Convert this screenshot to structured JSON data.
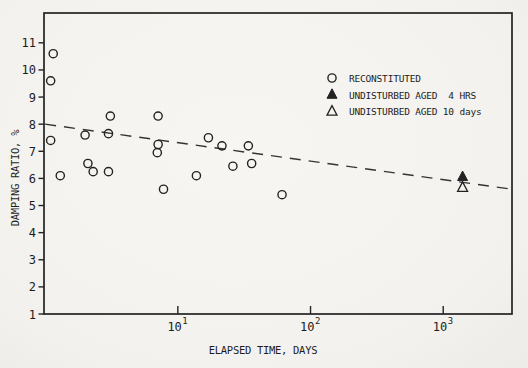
{
  "figure": {
    "kind": "scanned-scatter-plot",
    "paper_color": "#f5f4f1",
    "ink_color": "#232323"
  },
  "chart_data": {
    "type": "scatter",
    "title": "",
    "xlabel": "ELAPSED TIME, DAYS",
    "ylabel": "DAMPING RATIO, %",
    "x_scale": "log",
    "y_scale": "linear",
    "xlim": [
      0.98,
      3300
    ],
    "ylim": [
      1,
      12.1
    ],
    "grid": false,
    "x_ticks": [
      {
        "value": 10,
        "base": "10",
        "exponent": "1"
      },
      {
        "value": 100,
        "base": "10",
        "exponent": "2"
      },
      {
        "value": 1000,
        "base": "10",
        "exponent": "3"
      }
    ],
    "y_ticks": [
      {
        "value": 1,
        "label": "1"
      },
      {
        "value": 2,
        "label": "2"
      },
      {
        "value": 3,
        "label": "3"
      },
      {
        "value": 4,
        "label": "4"
      },
      {
        "value": 5,
        "label": "5"
      },
      {
        "value": 6,
        "label": "6"
      },
      {
        "value": 7,
        "label": "7"
      },
      {
        "value": 8,
        "label": "8"
      },
      {
        "value": 9,
        "label": "9"
      },
      {
        "value": 10,
        "label": "10"
      },
      {
        "value": 11,
        "label": "11"
      }
    ],
    "legend_position": "upper-right-inside",
    "legend": [
      {
        "marker": "open-circle",
        "label": "RECONSTITUTED"
      },
      {
        "marker": "filled-triangle",
        "label": "UNDISTURBED AGED  4 HRS"
      },
      {
        "marker": "open-triangle",
        "label": "UNDISTURBED AGED 10 days"
      }
    ],
    "series": [
      {
        "name": "RECONSTITUTED",
        "marker": "open-circle",
        "points": [
          [
            1.15,
            10.6
          ],
          [
            1.1,
            9.6
          ],
          [
            1.1,
            7.4
          ],
          [
            1.3,
            6.1
          ],
          [
            2.0,
            7.6
          ],
          [
            2.1,
            6.55
          ],
          [
            2.3,
            6.25
          ],
          [
            3.1,
            8.3
          ],
          [
            3.0,
            7.65
          ],
          [
            3.0,
            6.25
          ],
          [
            7.1,
            8.3
          ],
          [
            7.1,
            7.25
          ],
          [
            7.0,
            6.95
          ],
          [
            7.8,
            5.6
          ],
          [
            13.8,
            6.1
          ],
          [
            17,
            7.5
          ],
          [
            21.5,
            7.2
          ],
          [
            26,
            6.45
          ],
          [
            34,
            7.2
          ],
          [
            36,
            6.55
          ],
          [
            61,
            5.4
          ]
        ]
      },
      {
        "name": "UNDISTURBED AGED 4 HRS",
        "marker": "filled-triangle",
        "points": [
          [
            1400,
            6.05
          ]
        ]
      },
      {
        "name": "UNDISTURBED AGED 10 days",
        "marker": "open-triangle",
        "points": [
          [
            1400,
            5.65
          ]
        ]
      }
    ],
    "trend_line": {
      "style": "dashed",
      "x": [
        1.0,
        3300
      ],
      "y": [
        8.0,
        5.6
      ]
    }
  }
}
